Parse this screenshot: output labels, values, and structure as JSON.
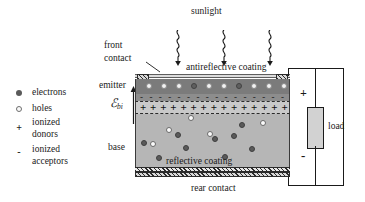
{
  "figure": {
    "title_text": "silicon solar cell cross-section",
    "labels": {
      "sunlight": "sunlight",
      "front_contact": "front\ncontact",
      "front_contact_line1": "front",
      "front_contact_line2": "contact",
      "antireflective_coating": "antireflective coating",
      "emitter": "emitter",
      "builtin_field": "ℰ",
      "builtin_field_sub": "bi",
      "base": "base",
      "reflective_coating": "reflective coating",
      "rear_contact": "rear contact",
      "load": "load",
      "terminal_plus": "+",
      "terminal_minus": "-"
    }
  },
  "legend": {
    "items": [
      {
        "symbol": "filled-circle",
        "label": "electrons"
      },
      {
        "symbol": "open-circle",
        "label": "holes"
      },
      {
        "symbol": "+",
        "label": "ionized",
        "label2": "donors"
      },
      {
        "symbol": "-",
        "label": "ionized",
        "label2": "acceptors"
      }
    ]
  },
  "colors": {
    "emitter_fill": "#7b7b7b",
    "acceptor_band_fill": "#8d8d8d",
    "depletion_fill": "#c9c9c9",
    "base_fill": "#b6b6b6",
    "antireflective_fill": "#dcdcdc",
    "load_fill": "#d2d2d2",
    "electron_fill": "#5a5a5a",
    "hole_fill": "#fbfbfb",
    "ink": "#1a1a1a"
  },
  "chart_data": {
    "type": "diagram",
    "layers": [
      {
        "name": "front contact",
        "style": "hatched",
        "count": 2
      },
      {
        "name": "antireflective coating",
        "style": "light-gray-strip"
      },
      {
        "name": "emitter",
        "style": "dark-gray",
        "carriers": "holes"
      },
      {
        "name": "ionized acceptors band",
        "style": "minus-signs"
      },
      {
        "name": "depletion region",
        "style": "plus-signs"
      },
      {
        "name": "base",
        "style": "light-gray",
        "carriers": "electrons and holes"
      },
      {
        "name": "reflective coating",
        "style": "hatched"
      },
      {
        "name": "rear contact",
        "style": "hatched"
      }
    ],
    "sunlight_rays": 3,
    "circuit": {
      "element": "load",
      "polarity_top": "+",
      "polarity_bottom": "-"
    }
  },
  "emitter_holes": [
    {
      "x": 10,
      "y": 4,
      "dark": false
    },
    {
      "x": 25,
      "y": 4,
      "dark": false
    },
    {
      "x": 40,
      "y": 4,
      "dark": false
    },
    {
      "x": 55,
      "y": 4,
      "dark": true
    },
    {
      "x": 70,
      "y": 4,
      "dark": false
    },
    {
      "x": 85,
      "y": 4,
      "dark": false
    },
    {
      "x": 100,
      "y": 4,
      "dark": true
    },
    {
      "x": 115,
      "y": 4,
      "dark": false
    },
    {
      "x": 130,
      "y": 4,
      "dark": false
    },
    {
      "x": 145,
      "y": 4,
      "dark": false
    }
  ],
  "base_carriers": [
    {
      "x": 52,
      "y": 1,
      "type": "hole"
    },
    {
      "x": 103,
      "y": 8,
      "type": "electron"
    },
    {
      "x": 124,
      "y": 6,
      "type": "hole"
    },
    {
      "x": 30,
      "y": 13,
      "type": "hole"
    },
    {
      "x": 39,
      "y": 18,
      "type": "electron"
    },
    {
      "x": 71,
      "y": 17,
      "type": "hole"
    },
    {
      "x": 76,
      "y": 22,
      "type": "electron"
    },
    {
      "x": 95,
      "y": 19,
      "type": "electron"
    },
    {
      "x": 5,
      "y": 26,
      "type": "electron"
    },
    {
      "x": 14,
      "y": 27,
      "type": "hole"
    },
    {
      "x": 47,
      "y": 31,
      "type": "electron"
    },
    {
      "x": 113,
      "y": 32,
      "type": "electron"
    },
    {
      "x": 20,
      "y": 41,
      "type": "electron"
    },
    {
      "x": 86,
      "y": 40,
      "type": "electron"
    }
  ]
}
